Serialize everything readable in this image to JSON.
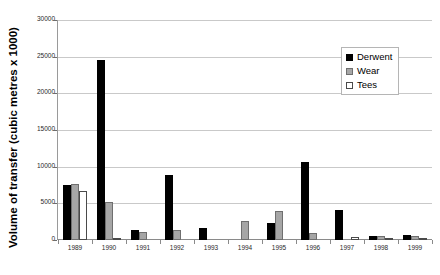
{
  "chart_data": {
    "type": "bar",
    "title": "",
    "xlabel": "",
    "ylabel": "Volume of transfer (cubic metres x 1000)",
    "ylim": [
      0,
      30000
    ],
    "ytick_values": [
      0,
      5000,
      10000,
      15000,
      20000,
      25000,
      30000
    ],
    "ytick_labels": [
      "0",
      "5000",
      "10000",
      "15000",
      "20000",
      "25000",
      "30000"
    ],
    "grid": true,
    "legend_position": "top-right",
    "categories": [
      "1989",
      "1990",
      "1991",
      "1992",
      "1993",
      "1994",
      "1995",
      "1996",
      "1997",
      "1998",
      "1999"
    ],
    "series": [
      {
        "name": "Derwent",
        "color": "#000000",
        "values": [
          7500,
          24600,
          1400,
          8900,
          1700,
          0,
          2300,
          10700,
          4100,
          500,
          750
        ]
      },
      {
        "name": "Wear",
        "color": "#a6a6a6",
        "values": [
          7650,
          5200,
          1100,
          1300,
          0,
          2600,
          4000,
          900,
          0,
          600,
          600
        ]
      },
      {
        "name": "Tees",
        "color": "#ffffff",
        "values": [
          6700,
          150,
          0,
          0,
          0,
          0,
          0,
          0,
          400,
          300,
          250
        ]
      }
    ]
  },
  "legend": {
    "items": [
      {
        "label": "Derwent"
      },
      {
        "label": "Wear"
      },
      {
        "label": "Tees"
      }
    ]
  }
}
